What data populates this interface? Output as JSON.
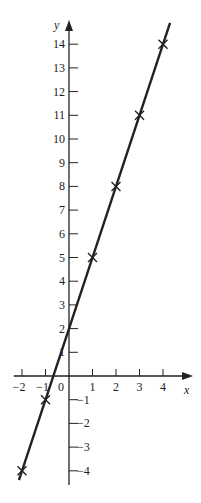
{
  "chart_data": {
    "type": "line",
    "title": "",
    "xlabel": "x",
    "ylabel": "y",
    "xlim": [
      -2,
      4
    ],
    "ylim": [
      -4,
      14
    ],
    "grid": false,
    "x_ticks": [
      -2,
      -1,
      0,
      1,
      2,
      3,
      4
    ],
    "x_tick_labels": [
      "−2",
      "−1",
      "0",
      "1",
      "2",
      "3",
      "4"
    ],
    "y_ticks": [
      -4,
      -3,
      -2,
      -1,
      1,
      2,
      3,
      4,
      5,
      6,
      7,
      8,
      9,
      10,
      11,
      12,
      13,
      14
    ],
    "y_tick_labels": [
      "−4",
      "−3",
      "−2",
      "−1",
      "1",
      "2",
      "3",
      "4",
      "5",
      "6",
      "7",
      "8",
      "9",
      "10",
      "11",
      "12",
      "13",
      "14"
    ],
    "series": [
      {
        "name": "y = 3x + 2",
        "marker": "x",
        "x": [
          -2,
          -1,
          1,
          2,
          3,
          4
        ],
        "y": [
          -4,
          -1,
          5,
          8,
          11,
          14
        ]
      }
    ],
    "line_color": "#222222"
  }
}
